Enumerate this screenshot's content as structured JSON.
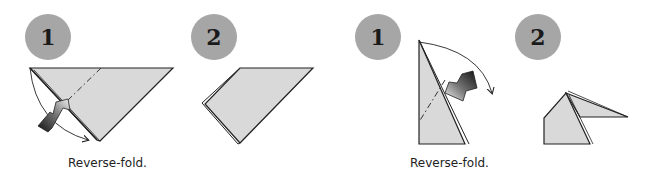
{
  "diagram": {
    "type": "origami-instructions",
    "colors": {
      "paper_fill": "#d9d9d9",
      "outline": "#222222",
      "badge_fill": "#a6a6a6",
      "badge_text": "#1a1a1a",
      "caption_text": "#222222"
    },
    "panels": [
      {
        "id": "left",
        "steps": [
          {
            "number": "1",
            "label": "step 1 - reverse fold (triangle)"
          },
          {
            "number": "2",
            "label": "step 2 - folded result"
          }
        ],
        "caption": "Reverse-fold."
      },
      {
        "id": "right",
        "steps": [
          {
            "number": "1",
            "label": "step 1 - reverse fold (point)"
          },
          {
            "number": "2",
            "label": "step 2 - folded head"
          }
        ],
        "caption": "Reverse-fold."
      }
    ]
  }
}
